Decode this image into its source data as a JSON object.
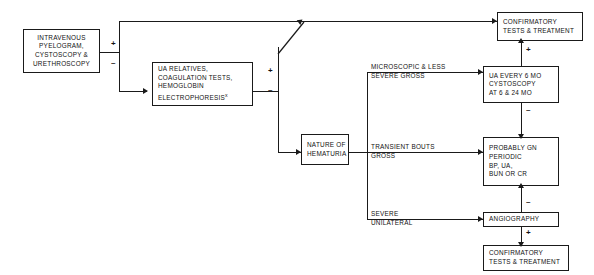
{
  "diagram": {
    "colors": {
      "ink": "#1a1a1a",
      "background": "#ffffff"
    },
    "boxes": [
      {
        "id": "ivp",
        "name": "box-intravenous-pyelogram",
        "lines": [
          "INTRAVENOUS",
          "PYELOGRAM,",
          "CYSTOSCOPY &",
          "URETHROSCOPY"
        ]
      },
      {
        "id": "ua-relatives",
        "name": "box-ua-relatives",
        "lines": [
          "UA RELATIVES,",
          "COAGULATION TESTS,",
          "HEMOGLOBIN",
          "ELECTROPHORESIS"
        ],
        "superscript": "x"
      },
      {
        "id": "nature",
        "name": "box-nature-of-hematuria",
        "lines": [
          "NATURE OF",
          "HEMATURIA"
        ]
      },
      {
        "id": "confirm-top",
        "name": "box-confirmatory-tests-top",
        "lines": [
          "CONFIRMATORY",
          "TESTS & TREATMENT"
        ]
      },
      {
        "id": "ua-every-6",
        "name": "box-ua-every-6-mo",
        "lines": [
          "UA  EVERY 6 MO",
          "CYSTOSCOPY",
          "AT 6 & 24 MO"
        ]
      },
      {
        "id": "probably-gn",
        "name": "box-probably-gn",
        "lines": [
          "PROBABLY GN",
          "PERIODIC",
          "BP, UA,",
          "BUN OR CR"
        ]
      },
      {
        "id": "angiography",
        "name": "box-angiography",
        "lines": [
          "ANGIOGRAPHY"
        ]
      },
      {
        "id": "confirm-bottom",
        "name": "box-confirmatory-tests-bottom",
        "lines": [
          "CONFIRMATORY",
          "TESTS & TREATMENT"
        ]
      }
    ],
    "branch_labels": [
      {
        "id": "microscopic",
        "name": "label-microscopic-less-severe-gross",
        "lines": [
          "MICROSCOPIC & LESS",
          "SEVERE GROSS"
        ]
      },
      {
        "id": "transient",
        "name": "label-transient-bouts-gross",
        "lines": [
          "TRANSIENT BOUTS",
          "GROSS"
        ]
      },
      {
        "id": "severe",
        "name": "label-severe-unilateral",
        "lines": [
          "SEVERE",
          "UNILATERAL"
        ]
      }
    ],
    "signs": [
      {
        "id": "ivp-plus",
        "name": "sign-plus-ivp",
        "symbol": "+"
      },
      {
        "id": "ivp-minus",
        "name": "sign-minus-ivp",
        "symbol": "–"
      },
      {
        "id": "ua-plus",
        "name": "sign-plus-ua-relatives",
        "symbol": "+"
      },
      {
        "id": "ua-minus",
        "name": "sign-minus-ua-relatives",
        "symbol": "–"
      },
      {
        "id": "follow-plus",
        "name": "sign-plus-followup",
        "symbol": "+"
      },
      {
        "id": "follow-minus",
        "name": "sign-minus-followup",
        "symbol": "–"
      },
      {
        "id": "angio-minus",
        "name": "sign-minus-angiography",
        "symbol": "–"
      },
      {
        "id": "angio-plus",
        "name": "sign-plus-angiography",
        "symbol": "+"
      }
    ]
  }
}
